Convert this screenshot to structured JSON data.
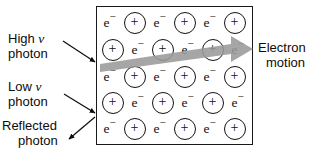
{
  "figure": {
    "background_color": "#ffffff",
    "line_color": "#141414",
    "arrow_gray": "#9a9a9a"
  },
  "lattice": {
    "box": {
      "border_color": "#1a1a1a",
      "fill": "#ffffff"
    },
    "electron_symbol": "e",
    "electron_charge_sign": "−",
    "ion_symbol": "+",
    "rows": [
      {
        "indent": false,
        "sites": [
          "electron",
          "ion",
          "electron",
          "ion",
          "electron",
          "ion"
        ]
      },
      {
        "indent": true,
        "sites": [
          "ion",
          "electron",
          "ion",
          "electron",
          "ion",
          "electron"
        ]
      },
      {
        "indent": false,
        "sites": [
          "electron",
          "ion",
          "electron",
          "ion",
          "electron",
          "ion"
        ]
      },
      {
        "indent": true,
        "sites": [
          "ion",
          "electron",
          "ion",
          "electron",
          "ion",
          "electron"
        ]
      },
      {
        "indent": false,
        "sites": [
          "electron",
          "ion",
          "electron",
          "ion",
          "electron",
          "ion"
        ]
      }
    ]
  },
  "labels": {
    "high_nu_photon": {
      "line1_pre": "High ",
      "line1_symbol": "ν",
      "line2": "photon"
    },
    "low_nu_photon": {
      "line1_pre": "Low ",
      "line1_symbol": "ν",
      "line2": "photon"
    },
    "reflected_photon": {
      "line1": "Reflected",
      "line2": "photon"
    },
    "electron_motion": {
      "line1": "Electron",
      "line2": "motion"
    }
  },
  "annotations": {
    "electron_motion_arrow": {
      "description": "thick gray tapered arrow pointing right and slightly up",
      "color": "#9a9a9a"
    },
    "high_nu_arrow": {
      "description": "thin arrow pointing right-down into lattice"
    },
    "low_nu_arrow": {
      "description": "thin arrow pointing right-down into lattice"
    },
    "reflected_arrow": {
      "description": "thin arrow pointing left-down away from lattice"
    }
  }
}
